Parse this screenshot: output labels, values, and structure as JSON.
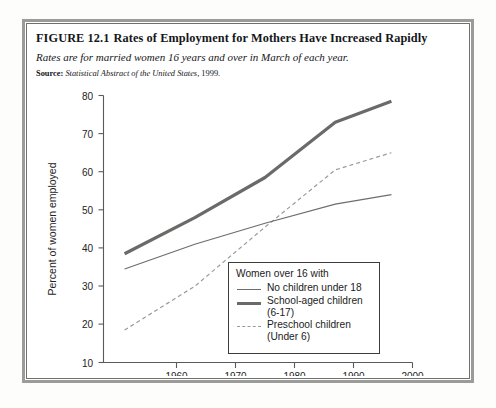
{
  "figure": {
    "number": "FIGURE 12.1",
    "title": "Rates of Employment for Mothers Have Increased Rapidly",
    "subtitle": "Rates are for married women 16 years and over in March of each year.",
    "source_label": "Source:",
    "source_text": "Statistical Abstract of the United States,",
    "source_year": "1999."
  },
  "legend": {
    "title": "Women over 16 with",
    "items": [
      {
        "label": "No children under 18",
        "style": "thin-solid"
      },
      {
        "label": "School-aged children",
        "label2": "(6-17)",
        "style": "bold-solid"
      },
      {
        "label": "Preschool children",
        "label2": "(Under 6)",
        "style": "dashed"
      }
    ]
  },
  "chart_data": {
    "type": "line",
    "title": "Rates of Employment for Mothers Have Increased Rapidly",
    "xlabel": "",
    "ylabel": "Percent of women employed",
    "x": [
      1960,
      1970,
      1980,
      1990,
      1998
    ],
    "xticks": [
      "1960",
      "1970",
      "1980",
      "1990",
      "2000"
    ],
    "xtick_values": [
      1960,
      1970,
      1980,
      1990,
      2000
    ],
    "yticks": [
      "10",
      "20",
      "30",
      "40",
      "50",
      "60",
      "70",
      "80"
    ],
    "ytick_values": [
      10,
      20,
      30,
      40,
      50,
      60,
      70,
      80
    ],
    "xlim": [
      1957,
      2001
    ],
    "ylim": [
      10,
      80
    ],
    "grid": false,
    "legend_position": "inside-lower-right",
    "series": [
      {
        "name": "No children under 18",
        "values": [
          34.5,
          41.0,
          46.5,
          51.5,
          54.0
        ],
        "style": "thin-solid",
        "color": "#6d6d6b"
      },
      {
        "name": "School-aged children (6-17)",
        "values": [
          38.5,
          48.0,
          58.5,
          73.0,
          78.5
        ],
        "style": "bold-solid",
        "color": "#6a6a68"
      },
      {
        "name": "Preschool children (Under 6)",
        "values": [
          18.5,
          30.0,
          45.5,
          60.5,
          65.0
        ],
        "style": "dashed",
        "color": "#9a9a98"
      }
    ]
  },
  "colors": {
    "frame_outer": "#9b9b99",
    "frame_inner": "#6f6f6d",
    "axis": "#5a5a58",
    "text": "#15161a"
  }
}
